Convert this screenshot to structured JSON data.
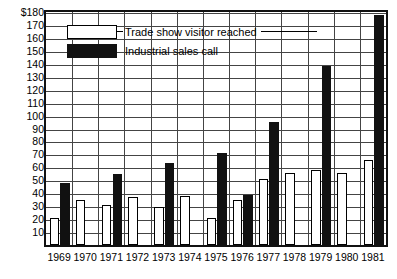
{
  "chart_data": {
    "type": "bar",
    "title": "",
    "xlabel": "",
    "ylabel": "",
    "ylim": [
      0,
      180
    ],
    "ytick_step": 10,
    "grid": true,
    "legend_position": "top-left-inside",
    "y_axis_unit_prefix": "$",
    "ytick_labels": [
      "$180",
      "170",
      "160",
      "150",
      "140",
      "130",
      "120",
      "110",
      "100",
      "90",
      "80",
      "70",
      "60",
      "50",
      "40",
      "30",
      "20",
      "10"
    ],
    "ytick_values": [
      180,
      170,
      160,
      150,
      140,
      130,
      120,
      110,
      100,
      90,
      80,
      70,
      60,
      50,
      40,
      30,
      20,
      10
    ],
    "categories": [
      "1969",
      "1970",
      "1971",
      "1972",
      "1973",
      "1974",
      "1975",
      "1976",
      "1977",
      "1978",
      "1979",
      "1980",
      "1981"
    ],
    "series": [
      {
        "name": "Trade show visitor reached",
        "color": "#ffffff",
        "edge_color": "#000000",
        "values": [
          21,
          35,
          31,
          37,
          29,
          38,
          21,
          35,
          51,
          56,
          58,
          56,
          66
        ]
      },
      {
        "name": "Industrial sales call",
        "color": "#111111",
        "edge_color": "#111111",
        "values": [
          48,
          0,
          55,
          0,
          63,
          0,
          71,
          39,
          95,
          0,
          138,
          0,
          178
        ]
      }
    ]
  },
  "legend": {
    "items": [
      {
        "label": "Trade show visitor reached",
        "swatch": "light",
        "has_leader": true,
        "has_tail": true
      },
      {
        "label": "Industrial sales call",
        "swatch": "dark",
        "has_leader": false,
        "has_tail": false
      }
    ]
  }
}
